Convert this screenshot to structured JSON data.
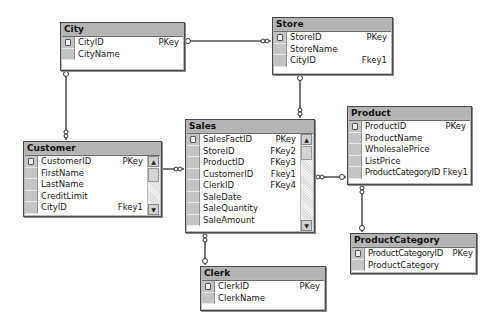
{
  "diagram": {
    "tables": {
      "city": {
        "title": "City",
        "columns": [
          {
            "name": "CityID",
            "key": "PKey",
            "primary": true
          },
          {
            "name": "CityName",
            "key": "",
            "primary": false
          }
        ]
      },
      "store": {
        "title": "Store",
        "columns": [
          {
            "name": "StoreID",
            "key": "PKey",
            "primary": true
          },
          {
            "name": "StoreName",
            "key": "",
            "primary": false
          },
          {
            "name": "CityID",
            "key": "Fkey1",
            "primary": false
          }
        ]
      },
      "customer": {
        "title": "Customer",
        "columns": [
          {
            "name": "CustomerID",
            "key": "PKey",
            "primary": true
          },
          {
            "name": "FirstName",
            "key": "",
            "primary": false
          },
          {
            "name": "LastName",
            "key": "",
            "primary": false
          },
          {
            "name": "CreditLimit",
            "key": "",
            "primary": false
          },
          {
            "name": "CityID",
            "key": "Fkey1",
            "primary": false
          }
        ]
      },
      "sales": {
        "title": "Sales",
        "columns": [
          {
            "name": "SalesFactID",
            "key": "PKey",
            "primary": true
          },
          {
            "name": "StoreID",
            "key": "FKey2",
            "primary": false
          },
          {
            "name": "ProductID",
            "key": "FKey3",
            "primary": false
          },
          {
            "name": "CustomerID",
            "key": "Fkey1",
            "primary": false
          },
          {
            "name": "ClerkID",
            "key": "FKey4",
            "primary": false
          },
          {
            "name": "SaleDate",
            "key": "",
            "primary": false
          },
          {
            "name": "SaleQuantity",
            "key": "",
            "primary": false
          },
          {
            "name": "SaleAmount",
            "key": "",
            "primary": false
          }
        ]
      },
      "product": {
        "title": "Product",
        "columns": [
          {
            "name": "ProductID",
            "key": "PKey",
            "primary": true
          },
          {
            "name": "ProductName",
            "key": "",
            "primary": false
          },
          {
            "name": "WholesalePrice",
            "key": "",
            "primary": false
          },
          {
            "name": "ListPrice",
            "key": "",
            "primary": false
          },
          {
            "name": "ProductCategoryID",
            "key": "Fkey1",
            "primary": false
          }
        ]
      },
      "productcategory": {
        "title": "ProductCategory",
        "columns": [
          {
            "name": "ProductCategoryID",
            "key": "PKey",
            "primary": true
          },
          {
            "name": "ProductCategory",
            "key": "",
            "primary": false
          }
        ]
      },
      "clerk": {
        "title": "Clerk",
        "columns": [
          {
            "name": "ClerkID",
            "key": "PKey",
            "primary": true
          },
          {
            "name": "ClerkName",
            "key": "",
            "primary": false
          }
        ]
      }
    },
    "relationships": [
      {
        "from": "City",
        "to": "Store",
        "via": "CityID"
      },
      {
        "from": "City",
        "to": "Customer",
        "via": "CityID"
      },
      {
        "from": "Store",
        "to": "Sales",
        "via": "StoreID"
      },
      {
        "from": "Customer",
        "to": "Sales",
        "via": "CustomerID"
      },
      {
        "from": "Product",
        "to": "Sales",
        "via": "ProductID"
      },
      {
        "from": "ProductCategory",
        "to": "Product",
        "via": "ProductCategoryID"
      },
      {
        "from": "Clerk",
        "to": "Sales",
        "via": "ClerkID"
      }
    ],
    "scroll_icons": {
      "up": "▲",
      "down": "▼"
    }
  }
}
